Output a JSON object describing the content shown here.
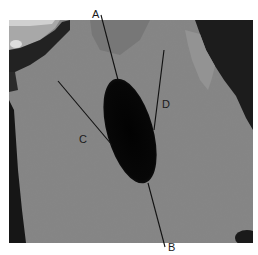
{
  "figure": {
    "background": "#ffffff",
    "scan_region": {
      "x": 9,
      "y": 20,
      "width": 244,
      "height": 223
    },
    "tissue_color": "#8a8a8a",
    "lesion_color": "#050505",
    "line_color": "#111111"
  },
  "labels": {
    "A": "A",
    "B": "B",
    "C": "C",
    "D": "D"
  },
  "annotations": [
    {
      "id": "A",
      "label": "A",
      "line": [
        [
          101,
          15
        ],
        [
          118,
          80
        ]
      ],
      "text_pos": [
        93,
        15
      ]
    },
    {
      "id": "B",
      "label": "B",
      "line": [
        [
          148,
          183
        ],
        [
          165,
          247
        ]
      ],
      "text_pos": [
        168,
        252
      ]
    },
    {
      "id": "C",
      "label": "C",
      "line": [
        [
          58,
          81
        ],
        [
          112,
          145
        ]
      ],
      "text_pos": [
        80,
        143
      ]
    },
    {
      "id": "D",
      "label": "D",
      "line": [
        [
          164,
          50
        ],
        [
          154,
          130
        ]
      ],
      "text_pos": [
        163,
        108
      ]
    }
  ]
}
